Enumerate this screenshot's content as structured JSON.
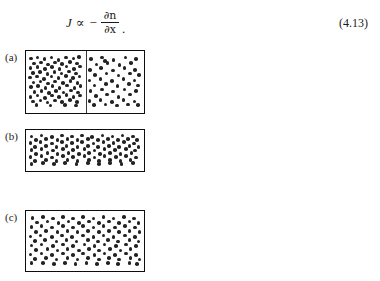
{
  "equation": {
    "flux_symbol": "J",
    "proportional_operator": "∝",
    "minus_sign": "−",
    "partial_symbol": "∂",
    "numerator_variable": "n",
    "denominator_variable": "x",
    "numerator": "∂n",
    "denominator": "∂x",
    "trailing_punctuation": ".",
    "number": "(4.13)",
    "plain_text": "J ∝ − ∂n/∂x."
  },
  "figure": {
    "panels": [
      {
        "label": "(a)",
        "has_divider": true,
        "divider_x_fraction": 0.5,
        "description": "particles concentrated on left side of partition",
        "left_dot_count": 76,
        "right_dot_count": 49
      },
      {
        "label": "(b)",
        "has_divider": false,
        "description": "partition removed, particles spreading",
        "dot_count": 96
      },
      {
        "label": "(c)",
        "has_divider": false,
        "description": "particles uniformly distributed at equilibrium",
        "dot_count": 116
      }
    ]
  },
  "colors": {
    "dot": "#232323",
    "border": "#0d0d0d",
    "divider": "#3a3a3a",
    "background": "#ffffff",
    "text": "#1a1a1a"
  },
  "geometry": {
    "panel_left": 25,
    "panel_width": 120,
    "panels": [
      {
        "top": 50,
        "height": 64
      },
      {
        "top": 129,
        "height": 43
      },
      {
        "top": 210,
        "height": 62
      }
    ],
    "label_left": 5,
    "dot_diameter": 3.6
  },
  "dots": {
    "a_left": [
      [
        0.05,
        0.07
      ],
      [
        0.17,
        0.05
      ],
      [
        0.3,
        0.08
      ],
      [
        0.43,
        0.05
      ],
      [
        0.56,
        0.09
      ],
      [
        0.7,
        0.05
      ],
      [
        0.84,
        0.07
      ],
      [
        0.94,
        0.04
      ],
      [
        0.11,
        0.16
      ],
      [
        0.24,
        0.14
      ],
      [
        0.37,
        0.18
      ],
      [
        0.5,
        0.14
      ],
      [
        0.63,
        0.17
      ],
      [
        0.77,
        0.13
      ],
      [
        0.9,
        0.16
      ],
      [
        0.04,
        0.25
      ],
      [
        0.17,
        0.23
      ],
      [
        0.31,
        0.27
      ],
      [
        0.44,
        0.23
      ],
      [
        0.58,
        0.26
      ],
      [
        0.71,
        0.22
      ],
      [
        0.85,
        0.26
      ],
      [
        0.96,
        0.22
      ],
      [
        0.09,
        0.34
      ],
      [
        0.22,
        0.32
      ],
      [
        0.36,
        0.36
      ],
      [
        0.49,
        0.32
      ],
      [
        0.62,
        0.35
      ],
      [
        0.76,
        0.31
      ],
      [
        0.89,
        0.35
      ],
      [
        0.03,
        0.43
      ],
      [
        0.16,
        0.41
      ],
      [
        0.29,
        0.45
      ],
      [
        0.43,
        0.41
      ],
      [
        0.56,
        0.44
      ],
      [
        0.7,
        0.4
      ],
      [
        0.83,
        0.44
      ],
      [
        0.95,
        0.41
      ],
      [
        0.1,
        0.52
      ],
      [
        0.23,
        0.5
      ],
      [
        0.37,
        0.54
      ],
      [
        0.5,
        0.5
      ],
      [
        0.64,
        0.53
      ],
      [
        0.78,
        0.49
      ],
      [
        0.91,
        0.53
      ],
      [
        0.05,
        0.61
      ],
      [
        0.18,
        0.59
      ],
      [
        0.32,
        0.63
      ],
      [
        0.45,
        0.59
      ],
      [
        0.58,
        0.62
      ],
      [
        0.72,
        0.58
      ],
      [
        0.86,
        0.62
      ],
      [
        0.97,
        0.59
      ],
      [
        0.12,
        0.7
      ],
      [
        0.25,
        0.68
      ],
      [
        0.38,
        0.72
      ],
      [
        0.52,
        0.68
      ],
      [
        0.65,
        0.71
      ],
      [
        0.79,
        0.67
      ],
      [
        0.92,
        0.71
      ],
      [
        0.04,
        0.79
      ],
      [
        0.17,
        0.77
      ],
      [
        0.31,
        0.81
      ],
      [
        0.44,
        0.77
      ],
      [
        0.57,
        0.8
      ],
      [
        0.71,
        0.76
      ],
      [
        0.84,
        0.8
      ],
      [
        0.96,
        0.77
      ],
      [
        0.09,
        0.88
      ],
      [
        0.23,
        0.86
      ],
      [
        0.36,
        0.9
      ],
      [
        0.5,
        0.86
      ],
      [
        0.63,
        0.89
      ],
      [
        0.77,
        0.85
      ],
      [
        0.9,
        0.89
      ],
      [
        0.15,
        0.95
      ],
      [
        0.41,
        0.96
      ],
      [
        0.68,
        0.95
      ],
      [
        0.88,
        0.96
      ]
    ],
    "a_right": [
      [
        0.08,
        0.08
      ],
      [
        0.28,
        0.05
      ],
      [
        0.5,
        0.09
      ],
      [
        0.72,
        0.05
      ],
      [
        0.92,
        0.08
      ],
      [
        0.18,
        0.18
      ],
      [
        0.39,
        0.15
      ],
      [
        0.61,
        0.19
      ],
      [
        0.82,
        0.15
      ],
      [
        0.06,
        0.28
      ],
      [
        0.27,
        0.25
      ],
      [
        0.49,
        0.29
      ],
      [
        0.7,
        0.25
      ],
      [
        0.9,
        0.28
      ],
      [
        0.16,
        0.38
      ],
      [
        0.37,
        0.35
      ],
      [
        0.59,
        0.39
      ],
      [
        0.8,
        0.35
      ],
      [
        0.97,
        0.38
      ],
      [
        0.05,
        0.48
      ],
      [
        0.26,
        0.45
      ],
      [
        0.47,
        0.49
      ],
      [
        0.68,
        0.45
      ],
      [
        0.89,
        0.48
      ],
      [
        0.15,
        0.58
      ],
      [
        0.36,
        0.55
      ],
      [
        0.57,
        0.59
      ],
      [
        0.78,
        0.55
      ],
      [
        0.95,
        0.58
      ],
      [
        0.07,
        0.68
      ],
      [
        0.28,
        0.65
      ],
      [
        0.49,
        0.69
      ],
      [
        0.7,
        0.65
      ],
      [
        0.91,
        0.68
      ],
      [
        0.17,
        0.78
      ],
      [
        0.38,
        0.75
      ],
      [
        0.59,
        0.79
      ],
      [
        0.8,
        0.75
      ],
      [
        0.05,
        0.87
      ],
      [
        0.26,
        0.85
      ],
      [
        0.47,
        0.89
      ],
      [
        0.68,
        0.85
      ],
      [
        0.89,
        0.88
      ],
      [
        0.14,
        0.95
      ],
      [
        0.35,
        0.94
      ],
      [
        0.56,
        0.96
      ],
      [
        0.77,
        0.94
      ],
      [
        0.95,
        0.95
      ],
      [
        0.34,
        0.11
      ]
    ],
    "b": [
      [
        0.03,
        0.08
      ],
      [
        0.12,
        0.05
      ],
      [
        0.21,
        0.09
      ],
      [
        0.3,
        0.05
      ],
      [
        0.39,
        0.08
      ],
      [
        0.48,
        0.05
      ],
      [
        0.57,
        0.09
      ],
      [
        0.66,
        0.05
      ],
      [
        0.75,
        0.08
      ],
      [
        0.84,
        0.05
      ],
      [
        0.93,
        0.08
      ],
      [
        0.07,
        0.18
      ],
      [
        0.16,
        0.15
      ],
      [
        0.26,
        0.19
      ],
      [
        0.35,
        0.15
      ],
      [
        0.44,
        0.18
      ],
      [
        0.53,
        0.15
      ],
      [
        0.62,
        0.19
      ],
      [
        0.71,
        0.15
      ],
      [
        0.8,
        0.18
      ],
      [
        0.89,
        0.15
      ],
      [
        0.97,
        0.19
      ],
      [
        0.02,
        0.29
      ],
      [
        0.11,
        0.26
      ],
      [
        0.21,
        0.3
      ],
      [
        0.3,
        0.26
      ],
      [
        0.39,
        0.29
      ],
      [
        0.48,
        0.26
      ],
      [
        0.58,
        0.3
      ],
      [
        0.67,
        0.26
      ],
      [
        0.76,
        0.29
      ],
      [
        0.85,
        0.26
      ],
      [
        0.94,
        0.3
      ],
      [
        0.06,
        0.4
      ],
      [
        0.16,
        0.37
      ],
      [
        0.25,
        0.41
      ],
      [
        0.34,
        0.37
      ],
      [
        0.44,
        0.4
      ],
      [
        0.53,
        0.37
      ],
      [
        0.62,
        0.41
      ],
      [
        0.72,
        0.37
      ],
      [
        0.81,
        0.4
      ],
      [
        0.9,
        0.37
      ],
      [
        0.98,
        0.41
      ],
      [
        0.03,
        0.51
      ],
      [
        0.12,
        0.48
      ],
      [
        0.22,
        0.52
      ],
      [
        0.31,
        0.48
      ],
      [
        0.4,
        0.51
      ],
      [
        0.5,
        0.48
      ],
      [
        0.59,
        0.52
      ],
      [
        0.68,
        0.48
      ],
      [
        0.77,
        0.51
      ],
      [
        0.87,
        0.48
      ],
      [
        0.95,
        0.52
      ],
      [
        0.07,
        0.62
      ],
      [
        0.17,
        0.59
      ],
      [
        0.26,
        0.63
      ],
      [
        0.36,
        0.59
      ],
      [
        0.45,
        0.62
      ],
      [
        0.54,
        0.59
      ],
      [
        0.64,
        0.63
      ],
      [
        0.73,
        0.59
      ],
      [
        0.82,
        0.62
      ],
      [
        0.92,
        0.59
      ],
      [
        0.02,
        0.73
      ],
      [
        0.12,
        0.7
      ],
      [
        0.21,
        0.74
      ],
      [
        0.31,
        0.7
      ],
      [
        0.4,
        0.73
      ],
      [
        0.5,
        0.7
      ],
      [
        0.59,
        0.74
      ],
      [
        0.68,
        0.7
      ],
      [
        0.78,
        0.73
      ],
      [
        0.87,
        0.7
      ],
      [
        0.96,
        0.74
      ],
      [
        0.06,
        0.84
      ],
      [
        0.16,
        0.81
      ],
      [
        0.25,
        0.85
      ],
      [
        0.35,
        0.81
      ],
      [
        0.44,
        0.84
      ],
      [
        0.54,
        0.81
      ],
      [
        0.63,
        0.85
      ],
      [
        0.73,
        0.81
      ],
      [
        0.82,
        0.84
      ],
      [
        0.91,
        0.81
      ],
      [
        0.03,
        0.94
      ],
      [
        0.13,
        0.92
      ],
      [
        0.23,
        0.95
      ],
      [
        0.33,
        0.92
      ],
      [
        0.43,
        0.94
      ],
      [
        0.53,
        0.92
      ],
      [
        0.63,
        0.95
      ],
      [
        0.73,
        0.92
      ],
      [
        0.83,
        0.94
      ],
      [
        0.93,
        0.92
      ]
    ],
    "c": [
      [
        0.04,
        0.06
      ],
      [
        0.13,
        0.04
      ],
      [
        0.22,
        0.07
      ],
      [
        0.31,
        0.04
      ],
      [
        0.4,
        0.07
      ],
      [
        0.49,
        0.04
      ],
      [
        0.58,
        0.07
      ],
      [
        0.67,
        0.04
      ],
      [
        0.76,
        0.07
      ],
      [
        0.85,
        0.04
      ],
      [
        0.94,
        0.07
      ],
      [
        0.08,
        0.15
      ],
      [
        0.17,
        0.13
      ],
      [
        0.27,
        0.16
      ],
      [
        0.36,
        0.13
      ],
      [
        0.45,
        0.16
      ],
      [
        0.54,
        0.13
      ],
      [
        0.63,
        0.16
      ],
      [
        0.72,
        0.13
      ],
      [
        0.81,
        0.16
      ],
      [
        0.9,
        0.13
      ],
      [
        0.98,
        0.16
      ],
      [
        0.03,
        0.24
      ],
      [
        0.12,
        0.22
      ],
      [
        0.21,
        0.25
      ],
      [
        0.31,
        0.22
      ],
      [
        0.4,
        0.25
      ],
      [
        0.49,
        0.22
      ],
      [
        0.58,
        0.25
      ],
      [
        0.67,
        0.22
      ],
      [
        0.77,
        0.25
      ],
      [
        0.86,
        0.22
      ],
      [
        0.95,
        0.25
      ],
      [
        0.07,
        0.33
      ],
      [
        0.16,
        0.31
      ],
      [
        0.26,
        0.34
      ],
      [
        0.35,
        0.31
      ],
      [
        0.44,
        0.34
      ],
      [
        0.53,
        0.31
      ],
      [
        0.63,
        0.34
      ],
      [
        0.72,
        0.31
      ],
      [
        0.81,
        0.34
      ],
      [
        0.9,
        0.31
      ],
      [
        0.99,
        0.34
      ],
      [
        0.02,
        0.42
      ],
      [
        0.11,
        0.4
      ],
      [
        0.21,
        0.43
      ],
      [
        0.3,
        0.4
      ],
      [
        0.39,
        0.43
      ],
      [
        0.49,
        0.4
      ],
      [
        0.58,
        0.43
      ],
      [
        0.67,
        0.4
      ],
      [
        0.76,
        0.43
      ],
      [
        0.86,
        0.4
      ],
      [
        0.95,
        0.43
      ],
      [
        0.06,
        0.51
      ],
      [
        0.15,
        0.49
      ],
      [
        0.25,
        0.52
      ],
      [
        0.34,
        0.49
      ],
      [
        0.43,
        0.52
      ],
      [
        0.53,
        0.49
      ],
      [
        0.62,
        0.52
      ],
      [
        0.71,
        0.49
      ],
      [
        0.8,
        0.52
      ],
      [
        0.9,
        0.49
      ],
      [
        0.98,
        0.52
      ],
      [
        0.03,
        0.6
      ],
      [
        0.12,
        0.58
      ],
      [
        0.22,
        0.61
      ],
      [
        0.31,
        0.58
      ],
      [
        0.4,
        0.61
      ],
      [
        0.5,
        0.58
      ],
      [
        0.59,
        0.61
      ],
      [
        0.68,
        0.58
      ],
      [
        0.78,
        0.61
      ],
      [
        0.87,
        0.58
      ],
      [
        0.96,
        0.61
      ],
      [
        0.07,
        0.69
      ],
      [
        0.17,
        0.67
      ],
      [
        0.26,
        0.7
      ],
      [
        0.35,
        0.67
      ],
      [
        0.45,
        0.7
      ],
      [
        0.54,
        0.67
      ],
      [
        0.63,
        0.7
      ],
      [
        0.73,
        0.67
      ],
      [
        0.82,
        0.7
      ],
      [
        0.91,
        0.67
      ],
      [
        0.02,
        0.78
      ],
      [
        0.12,
        0.76
      ],
      [
        0.21,
        0.79
      ],
      [
        0.31,
        0.76
      ],
      [
        0.4,
        0.79
      ],
      [
        0.49,
        0.76
      ],
      [
        0.59,
        0.79
      ],
      [
        0.68,
        0.76
      ],
      [
        0.77,
        0.79
      ],
      [
        0.87,
        0.76
      ],
      [
        0.96,
        0.79
      ],
      [
        0.06,
        0.87
      ],
      [
        0.16,
        0.85
      ],
      [
        0.25,
        0.88
      ],
      [
        0.35,
        0.85
      ],
      [
        0.44,
        0.88
      ],
      [
        0.53,
        0.85
      ],
      [
        0.63,
        0.88
      ],
      [
        0.72,
        0.85
      ],
      [
        0.81,
        0.88
      ],
      [
        0.91,
        0.85
      ],
      [
        0.99,
        0.88
      ],
      [
        0.03,
        0.95
      ],
      [
        0.13,
        0.94
      ],
      [
        0.23,
        0.96
      ],
      [
        0.33,
        0.94
      ],
      [
        0.42,
        0.96
      ],
      [
        0.52,
        0.94
      ],
      [
        0.61,
        0.96
      ],
      [
        0.71,
        0.94
      ],
      [
        0.8,
        0.96
      ],
      [
        0.9,
        0.94
      ],
      [
        0.97,
        0.96
      ]
    ]
  }
}
